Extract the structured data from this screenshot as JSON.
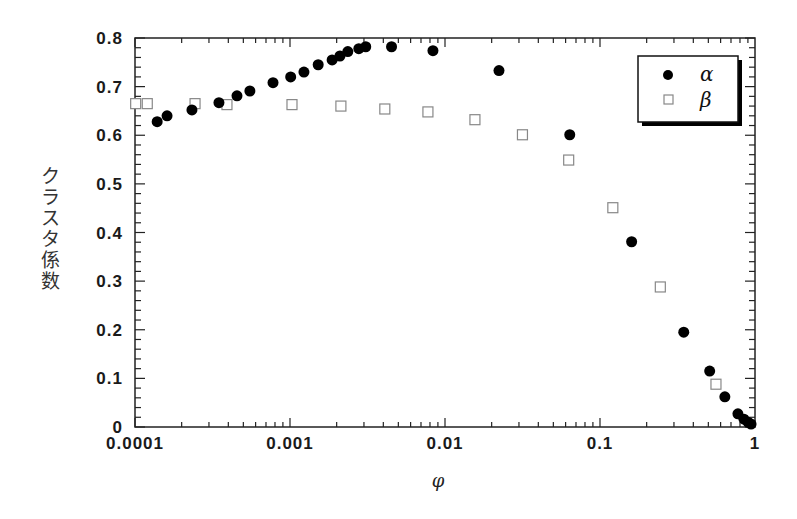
{
  "chart_data": {
    "type": "scatter",
    "title": "",
    "xlabel": "φ",
    "ylabel": "クラスタ係数",
    "xscale": "log",
    "xlim": [
      0.0001,
      1
    ],
    "ylim": [
      0,
      0.8
    ],
    "x_ticks": [
      "0.0001",
      "0.001",
      "0.01",
      "0.1",
      "1"
    ],
    "y_ticks": [
      "0",
      "0.1",
      "0.2",
      "0.3",
      "0.4",
      "0.5",
      "0.6",
      "0.7",
      "0.8"
    ],
    "grid": false,
    "legend_position": "upper right",
    "series": [
      {
        "name": "α",
        "marker": "filled-circle",
        "color": "#000000",
        "x": [
          0.000139,
          0.000161,
          0.000233,
          0.000348,
          0.000455,
          0.000551,
          0.000777,
          0.00101,
          0.00123,
          0.00152,
          0.00187,
          0.0021,
          0.00236,
          0.00278,
          0.00308,
          0.00452,
          0.00836,
          0.0223,
          0.0638,
          0.16,
          0.347,
          0.51,
          0.639,
          0.776,
          0.849,
          0.901,
          0.943
        ],
        "y": [
          0.628,
          0.64,
          0.652,
          0.667,
          0.681,
          0.691,
          0.708,
          0.72,
          0.73,
          0.745,
          0.755,
          0.763,
          0.772,
          0.778,
          0.782,
          0.782,
          0.774,
          0.733,
          0.601,
          0.381,
          0.195,
          0.115,
          0.062,
          0.027,
          0.016,
          0.01,
          0.006
        ]
      },
      {
        "name": "β",
        "marker": "open-square",
        "color": "#888888",
        "x": [
          0.000101,
          0.00012,
          0.000244,
          0.000392,
          0.00103,
          0.00213,
          0.00409,
          0.00776,
          0.0156,
          0.0316,
          0.0628,
          0.121,
          0.245,
          0.56
        ],
        "y": [
          0.665,
          0.665,
          0.665,
          0.663,
          0.663,
          0.66,
          0.654,
          0.648,
          0.632,
          0.601,
          0.549,
          0.451,
          0.288,
          0.088
        ]
      }
    ]
  },
  "legend": {
    "items": [
      {
        "label": "α"
      },
      {
        "label": "β"
      }
    ]
  }
}
